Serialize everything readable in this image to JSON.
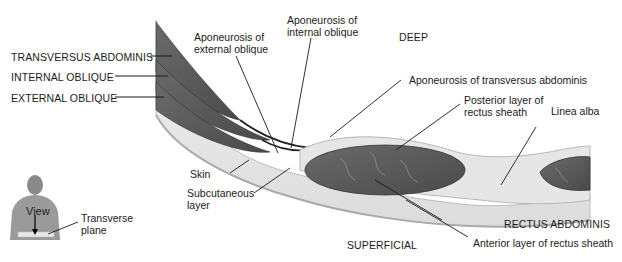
{
  "diagram": {
    "orientation": {
      "top": "DEEP",
      "bottom": "SUPERFICIAL"
    },
    "left_labels": [
      {
        "id": "transversus",
        "text": "TRANSVERSUS ABDOMINIS"
      },
      {
        "id": "internal",
        "text": "INTERNAL OBLIQUE"
      },
      {
        "id": "external",
        "text": "EXTERNAL OBLIQUE"
      }
    ],
    "callouts": {
      "apo_external": "Aponeurosis of\nexternal oblique",
      "apo_internal": "Aponeurosis of\ninternal oblique",
      "apo_transversus": "Aponeurosis of transversus abdominis",
      "posterior_sheath": "Posterior layer of\nrectus sheath",
      "linea_alba": "Linea alba",
      "skin": "Skin",
      "subcutaneous": "Subcutaneous\nlayer",
      "rectus": "RECTUS ABDOMINIS",
      "anterior_sheath": "Anterior layer of rectus sheath"
    },
    "inset": {
      "view_label": "View",
      "plane_label": "Transverse\nplane"
    },
    "colors": {
      "muscle": "#5a5a5a",
      "muscle_dark": "#3c3c3c",
      "fascia": "#d9d9d9",
      "fat": "#ececec",
      "skin": "#c8c8c8",
      "leader": "#1a1a1a"
    }
  }
}
